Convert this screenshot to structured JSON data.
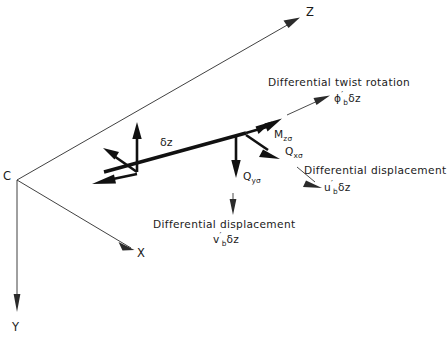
{
  "figure": {
    "name": "differential-beam-element-forces-diagram",
    "background_color": "#ffffff",
    "line_color": "#111111",
    "thin_line_color": "#2b2b2b"
  },
  "axes": {
    "origin_label": "C",
    "items": [
      {
        "name": "z-axis",
        "label": "Z",
        "direction": "up-right"
      },
      {
        "name": "x-axis",
        "label": "X",
        "direction": "down-right"
      },
      {
        "name": "y-axis",
        "label": "Y",
        "direction": "down"
      }
    ]
  },
  "element": {
    "length_label": "δz",
    "description_name": "differential-beam-segment"
  },
  "force_labels": {
    "moment_z": {
      "symbol": "M",
      "subscript": "zσ",
      "full": "M zσ"
    },
    "shear_x": {
      "symbol": "Q",
      "subscript": "xσ",
      "full": "Q xσ"
    },
    "shear_y": {
      "symbol": "Q",
      "subscript": "yσ",
      "full": "Q yσ"
    }
  },
  "annotations": [
    {
      "name": "differential-twist-rotation",
      "caption": "Differential  twist  rotation",
      "symbol_base": "ϕ",
      "symbol_prime": "′",
      "symbol_sub": "b",
      "symbol_tail": "δz",
      "symbol_full": "ϕ′b δz"
    },
    {
      "name": "differential-displacement-u",
      "caption": "Differential  displacement",
      "symbol_base": "u",
      "symbol_prime": "′",
      "symbol_sub": "b",
      "symbol_tail": "δz",
      "symbol_full": "u′b δz"
    },
    {
      "name": "differential-displacement-v",
      "caption": "Differential  displacement",
      "symbol_base": "v",
      "symbol_prime": "′",
      "symbol_sub": "b",
      "symbol_tail": "δz",
      "symbol_full": "v′b δz"
    }
  ]
}
